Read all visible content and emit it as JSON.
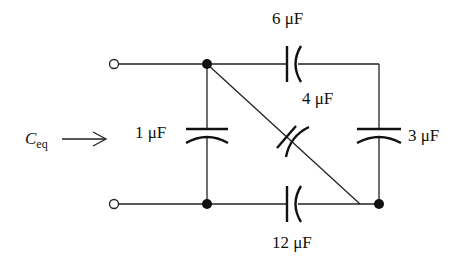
{
  "diagram": {
    "type": "circuit",
    "input_label": {
      "main": "C",
      "subscript": "eq"
    },
    "capacitors": [
      {
        "id": "c6",
        "label": "6 μF",
        "value": 6,
        "unit": "μF",
        "position": "top"
      },
      {
        "id": "c4",
        "label": "4 μF",
        "value": 4,
        "unit": "μF",
        "position": "diagonal"
      },
      {
        "id": "c1",
        "label": "1 μF",
        "value": 1,
        "unit": "μF",
        "position": "left"
      },
      {
        "id": "c3",
        "label": "3 μF",
        "value": 3,
        "unit": "μF",
        "position": "right"
      },
      {
        "id": "c12",
        "label": "12 μF",
        "value": 12,
        "unit": "μF",
        "position": "bottom"
      }
    ],
    "colors": {
      "line": "#222222",
      "background": "#ffffff"
    }
  }
}
